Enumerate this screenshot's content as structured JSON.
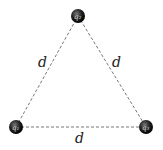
{
  "diagram": {
    "type": "equilateral-triangle-charges",
    "side_label": "d",
    "charges": [
      {
        "id": "q1",
        "label": "q₁",
        "position": "bottom-left",
        "x": 16,
        "y": 127
      },
      {
        "id": "q2",
        "label": "q₂",
        "position": "top",
        "x": 78,
        "y": 16
      },
      {
        "id": "q3",
        "label": "q₃",
        "position": "bottom-right",
        "x": 146,
        "y": 127
      }
    ],
    "sides": [
      {
        "from": "q1",
        "to": "q2",
        "label": "d"
      },
      {
        "from": "q2",
        "to": "q3",
        "label": "d"
      },
      {
        "from": "q1",
        "to": "q3",
        "label": "d"
      }
    ],
    "colors": {
      "line": "#777777",
      "charge": "#1a1a1a"
    }
  }
}
